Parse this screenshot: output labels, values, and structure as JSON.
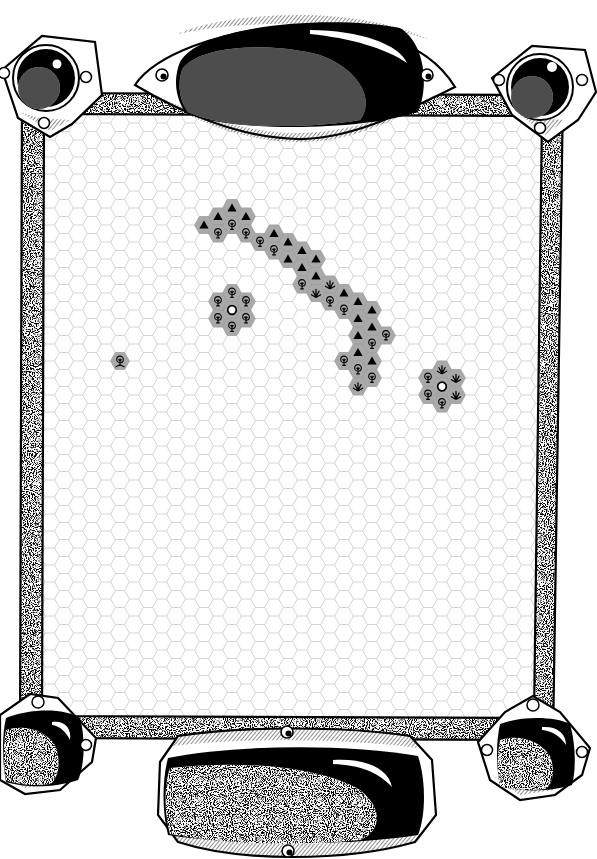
{
  "board": {
    "kind": "hex-map",
    "colors": {
      "background": "#ffffff",
      "grid_line": "#c9c9c9",
      "terrain_fill": "#a9a9a9",
      "terrain_stroke": "#9a9a9a",
      "icon": "#000000",
      "frame_ink": "#000000"
    },
    "terrain_icons": {
      "mountain": "mountain-icon",
      "forest": "tree-icon",
      "marsh": "marsh-icon",
      "town": "town-icon",
      "swamp-forest": "swamp-tree-icon"
    },
    "hexes": [
      {
        "col": 12,
        "row": 7,
        "terrain": "mountain"
      },
      {
        "col": 13,
        "row": 6,
        "terrain": "mountain"
      },
      {
        "col": 13,
        "row": 7,
        "terrain": "forest"
      },
      {
        "col": 14,
        "row": 6,
        "terrain": "mountain"
      },
      {
        "col": 14,
        "row": 7,
        "terrain": "forest"
      },
      {
        "col": 15,
        "row": 6,
        "terrain": "mountain"
      },
      {
        "col": 15,
        "row": 7,
        "terrain": "forest"
      },
      {
        "col": 16,
        "row": 8,
        "terrain": "forest"
      },
      {
        "col": 17,
        "row": 7,
        "terrain": "mountain"
      },
      {
        "col": 17,
        "row": 8,
        "terrain": "forest"
      },
      {
        "col": 18,
        "row": 8,
        "terrain": "mountain"
      },
      {
        "col": 18,
        "row": 9,
        "terrain": "mountain"
      },
      {
        "col": 19,
        "row": 8,
        "terrain": "mountain"
      },
      {
        "col": 19,
        "row": 9,
        "terrain": "mountain"
      },
      {
        "col": 19,
        "row": 10,
        "terrain": "forest"
      },
      {
        "col": 20,
        "row": 9,
        "terrain": "mountain"
      },
      {
        "col": 20,
        "row": 10,
        "terrain": "mountain"
      },
      {
        "col": 20,
        "row": 11,
        "terrain": "marsh"
      },
      {
        "col": 21,
        "row": 10,
        "terrain": "marsh"
      },
      {
        "col": 21,
        "row": 11,
        "terrain": "forest"
      },
      {
        "col": 22,
        "row": 11,
        "terrain": "mountain"
      },
      {
        "col": 22,
        "row": 12,
        "terrain": "forest"
      },
      {
        "col": 22,
        "row": 15,
        "terrain": "forest"
      },
      {
        "col": 23,
        "row": 11,
        "terrain": "mountain"
      },
      {
        "col": 23,
        "row": 12,
        "terrain": "mountain"
      },
      {
        "col": 23,
        "row": 13,
        "terrain": "mountain"
      },
      {
        "col": 23,
        "row": 14,
        "terrain": "mountain"
      },
      {
        "col": 23,
        "row": 15,
        "terrain": "forest"
      },
      {
        "col": 23,
        "row": 16,
        "terrain": "marsh"
      },
      {
        "col": 24,
        "row": 12,
        "terrain": "mountain"
      },
      {
        "col": 24,
        "row": 13,
        "terrain": "mountain"
      },
      {
        "col": 24,
        "row": 14,
        "terrain": "forest"
      },
      {
        "col": 24,
        "row": 15,
        "terrain": "mountain"
      },
      {
        "col": 24,
        "row": 16,
        "terrain": "forest"
      },
      {
        "col": 25,
        "row": 13,
        "terrain": "forest"
      },
      {
        "col": 13,
        "row": 11,
        "terrain": "forest"
      },
      {
        "col": 13,
        "row": 12,
        "terrain": "forest"
      },
      {
        "col": 14,
        "row": 11,
        "terrain": "forest"
      },
      {
        "col": 14,
        "row": 12,
        "terrain": "town"
      },
      {
        "col": 14,
        "row": 13,
        "terrain": "forest"
      },
      {
        "col": 15,
        "row": 11,
        "terrain": "forest"
      },
      {
        "col": 15,
        "row": 12,
        "terrain": "forest"
      },
      {
        "col": 28,
        "row": 16,
        "terrain": "forest"
      },
      {
        "col": 28,
        "row": 17,
        "terrain": "forest"
      },
      {
        "col": 29,
        "row": 15,
        "terrain": "marsh"
      },
      {
        "col": 29,
        "row": 16,
        "terrain": "town"
      },
      {
        "col": 29,
        "row": 17,
        "terrain": "forest"
      },
      {
        "col": 30,
        "row": 16,
        "terrain": "marsh"
      },
      {
        "col": 30,
        "row": 17,
        "terrain": "marsh"
      },
      {
        "col": 6,
        "row": 15,
        "terrain": "swamp-forest"
      }
    ]
  }
}
